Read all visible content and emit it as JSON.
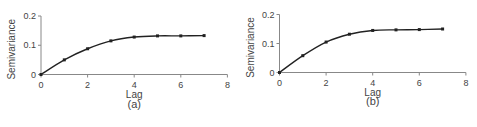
{
  "chart_data": [
    {
      "type": "line",
      "title": "",
      "caption": "(a)",
      "xlabel": "Lag",
      "ylabel": "Semivariance",
      "x": [
        0,
        1,
        2,
        3,
        4,
        5,
        6,
        7
      ],
      "series": [
        {
          "name": "semivariogram",
          "values": [
            0,
            0.05,
            0.088,
            0.115,
            0.128,
            0.132,
            0.132,
            0.133
          ]
        }
      ],
      "xlim": [
        0,
        8
      ],
      "ylim": [
        0,
        0.2
      ],
      "xticks": [
        "0",
        "2",
        "4",
        "6",
        "8"
      ],
      "yticks": [
        "0",
        "0.1",
        "0.2"
      ],
      "grid": false,
      "legend": "none"
    },
    {
      "type": "line",
      "title": "",
      "caption": "(b)",
      "xlabel": "Lag",
      "ylabel": "Semivariance",
      "x": [
        0,
        1,
        2,
        3,
        4,
        5,
        6,
        7
      ],
      "series": [
        {
          "name": "semivariogram",
          "values": [
            0,
            0.058,
            0.105,
            0.132,
            0.145,
            0.147,
            0.148,
            0.15
          ]
        }
      ],
      "xlim": [
        0,
        8
      ],
      "ylim": [
        0,
        0.2
      ],
      "xticks": [
        "0",
        "2",
        "4",
        "6",
        "8"
      ],
      "yticks": [
        "0",
        "0.1",
        "0.2"
      ],
      "grid": false,
      "legend": "none"
    }
  ]
}
